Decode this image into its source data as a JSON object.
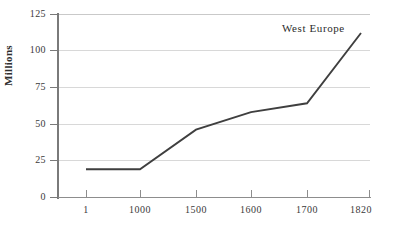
{
  "chart_data": {
    "type": "line",
    "title": "",
    "subtitle": "",
    "xlabel": "",
    "ylabel": "Millions",
    "categories": [
      "1",
      "1000",
      "1500",
      "1600",
      "1700",
      "1820"
    ],
    "x": [
      1,
      1000,
      1500,
      1600,
      1700,
      1820
    ],
    "series": [
      {
        "name": "West Europe",
        "values": [
          19,
          19,
          46,
          58,
          64,
          112
        ]
      }
    ],
    "ylim": [
      0,
      125
    ],
    "yticks": [
      0,
      25,
      50,
      75,
      100,
      125
    ],
    "ytick_labels": [
      "0",
      "25",
      "50",
      "75",
      "100",
      "125"
    ],
    "xtick_labels": [
      "1",
      "1000",
      "1500",
      "1600",
      "1700",
      "1820"
    ],
    "grid": "horizontal",
    "legend_position": "inline-annotation",
    "annotations": [
      {
        "text": "West Europe",
        "near_x": 1750,
        "near_y": 118
      }
    ],
    "colors": {
      "line": "#3a3a3a",
      "grid": "#d8d8d8",
      "axis": "#7a7a7a",
      "text": "#2e2e2e",
      "background": "#ffffff"
    }
  },
  "axis": {
    "y_title": "Millions",
    "y_labels": [
      "125",
      "100",
      "75",
      "50",
      "25",
      "0"
    ],
    "x_labels": [
      "1",
      "1000",
      "1500",
      "1600",
      "1700",
      "1820"
    ]
  },
  "annotation": {
    "series_label": "West Europe"
  }
}
